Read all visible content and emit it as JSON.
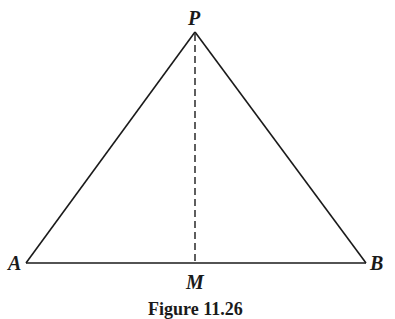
{
  "figure": {
    "caption": "Figure 11.26",
    "labels": {
      "apex": "P",
      "left_vertex": "A",
      "right_vertex": "B",
      "foot": "M"
    },
    "geometry": {
      "P": [
        195,
        32
      ],
      "A": [
        26,
        263
      ],
      "B": [
        366,
        263
      ],
      "M": [
        195,
        263
      ]
    },
    "line_color": "#1a1a1a"
  }
}
